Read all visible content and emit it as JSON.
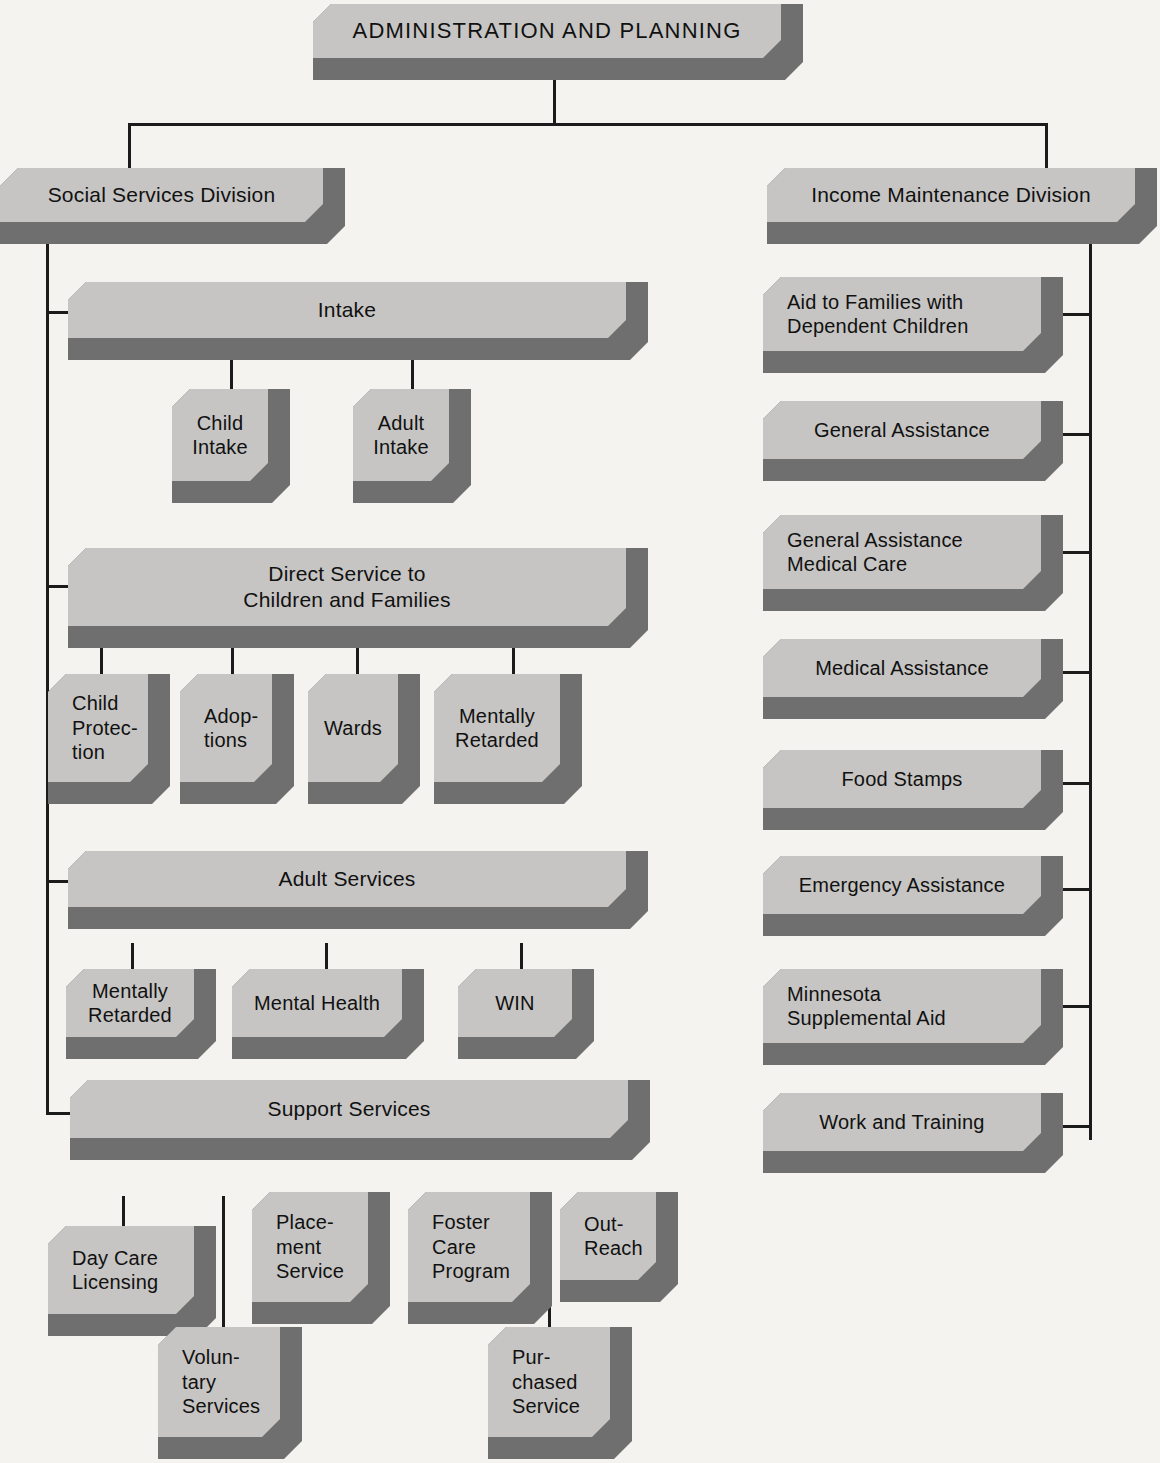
{
  "diagram": {
    "type": "organization-chart",
    "title": "ADMINISTRATION AND PLANNING",
    "colors": {
      "box_face": "#c6c5c3",
      "box_shadow": "#6f6f6f",
      "connector": "#1b1b1b",
      "background": "#f4f3f0",
      "text": "#111111"
    },
    "root": {
      "label": "ADMINISTRATION AND PLANNING"
    },
    "divisions": [
      {
        "id": "social-services-division",
        "label": "Social Services Division"
      },
      {
        "id": "income-maintenance-division",
        "label": "Income Maintenance Division"
      }
    ],
    "social_services": {
      "sections": [
        {
          "id": "intake",
          "label": "Intake",
          "children": [
            {
              "id": "child-intake",
              "label": "Child\nIntake"
            },
            {
              "id": "adult-intake",
              "label": "Adult\nIntake"
            }
          ]
        },
        {
          "id": "direct-service-to-children-and-families",
          "label": "Direct Service to\nChildren and Families",
          "children": [
            {
              "id": "child-protection",
              "label": "Child\nProtec-\ntion"
            },
            {
              "id": "adoptions",
              "label": "Adop-\ntions"
            },
            {
              "id": "wards",
              "label": "Wards"
            },
            {
              "id": "mentally-retarded-children",
              "label": "Mentally\nRetarded"
            }
          ]
        },
        {
          "id": "adult-services",
          "label": "Adult Services",
          "children": [
            {
              "id": "mentally-retarded-adults",
              "label": "Mentally\nRetarded"
            },
            {
              "id": "mental-health",
              "label": "Mental Health"
            },
            {
              "id": "win",
              "label": "WIN"
            }
          ]
        },
        {
          "id": "support-services",
          "label": "Support Services",
          "children": [
            {
              "id": "day-care-licensing",
              "label": "Day Care\nLicensing"
            },
            {
              "id": "voluntary-services",
              "label": "Volun-\ntary\nServices"
            },
            {
              "id": "placement-service",
              "label": "Place-\nment\nService"
            },
            {
              "id": "foster-care-program",
              "label": "Foster\nCare\nProgram"
            },
            {
              "id": "purchased-service",
              "label": "Pur-\nchased\nService"
            },
            {
              "id": "out-reach",
              "label": "Out-\nReach"
            }
          ]
        }
      ]
    },
    "income_maintenance": {
      "programs": [
        {
          "id": "aid-to-families-with-dependent-children",
          "label": "Aid to Families with\nDependent Children"
        },
        {
          "id": "general-assistance",
          "label": "General Assistance"
        },
        {
          "id": "general-assistance-medical-care",
          "label": "General Assistance\nMedical Care"
        },
        {
          "id": "medical-assistance",
          "label": "Medical Assistance"
        },
        {
          "id": "food-stamps",
          "label": "Food Stamps"
        },
        {
          "id": "emergency-assistance",
          "label": "Emergency Assistance"
        },
        {
          "id": "minnesota-supplemental-aid",
          "label": "Minnesota\nSupplemental Aid"
        },
        {
          "id": "work-and-training",
          "label": "Work and Training"
        }
      ]
    }
  }
}
